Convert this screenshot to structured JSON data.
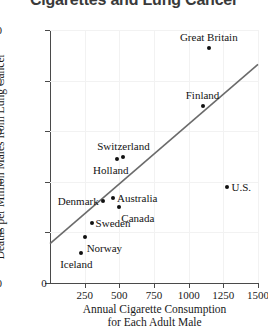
{
  "title": "Cigarettes and Lung Cancer",
  "axes": {
    "x_title_line1": "Annual Cigarette Consumption",
    "x_title_line2": "for Each Adult Male",
    "y_title": "Deaths per Million Males from Lung Cancer",
    "x_ticks": [
      "0",
      "250",
      "500",
      "750",
      "1000",
      "1250",
      "1500"
    ],
    "y_ticks": [
      "0",
      "100",
      "200",
      "300",
      "400",
      "500"
    ]
  },
  "colors": {
    "point": "#111111",
    "line": "#6b6b6b",
    "grid": "#f2f2f2",
    "axis": "#4a4a4a",
    "title": "#3a3a3a"
  },
  "chart_data": {
    "type": "scatter",
    "title": "Cigarettes and Lung Cancer",
    "xlabel": "Annual Cigarette Consumption for Each Adult Male",
    "ylabel": "Deaths per Million Males from Lung Cancer",
    "xlim": [
      0,
      1500
    ],
    "ylim": [
      0,
      500
    ],
    "xticks": [
      0,
      250,
      500,
      750,
      1000,
      1250,
      1500
    ],
    "yticks": [
      0,
      100,
      200,
      300,
      400,
      500
    ],
    "grid": true,
    "legend": "none",
    "points": [
      {
        "label": "Great Britain",
        "x": 1145,
        "y": 465,
        "label_pos": "above"
      },
      {
        "label": "Finland",
        "x": 1100,
        "y": 350,
        "label_pos": "above"
      },
      {
        "label": "U.S.",
        "x": 1280,
        "y": 190,
        "label_pos": "right"
      },
      {
        "label": "Switzerland",
        "x": 530,
        "y": 250,
        "label_pos": "above"
      },
      {
        "label": "Holland",
        "x": 480,
        "y": 245,
        "label_pos": "below-left"
      },
      {
        "label": "Denmark",
        "x": 380,
        "y": 163,
        "label_pos": "left"
      },
      {
        "label": "Australia",
        "x": 455,
        "y": 168,
        "label_pos": "right"
      },
      {
        "label": "Canada",
        "x": 500,
        "y": 150,
        "label_pos": "below-right"
      },
      {
        "label": "Sweden",
        "x": 300,
        "y": 118,
        "label_pos": "right"
      },
      {
        "label": "Norway",
        "x": 250,
        "y": 90,
        "label_pos": "below-right"
      },
      {
        "label": "Iceland",
        "x": 220,
        "y": 60,
        "label_pos": "below-left"
      }
    ],
    "trendline": {
      "x0": 0,
      "y0": 78,
      "x1": 1500,
      "y1": 432
    }
  }
}
